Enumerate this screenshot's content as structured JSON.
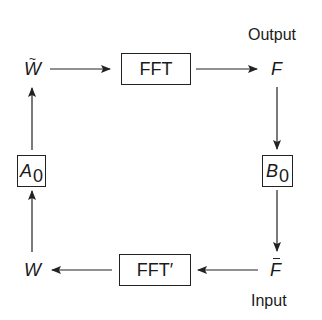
{
  "diagram": {
    "type": "iterative-algorithm-loop",
    "labels": {
      "output": "Output",
      "input": "Input"
    },
    "nodes": {
      "w_tilde": {
        "symbol": "W",
        "decoration": "tilde",
        "tilde": "~"
      },
      "f": {
        "symbol": "F"
      },
      "w": {
        "symbol": "W"
      },
      "f_bar": {
        "symbol": "F",
        "decoration": "bar"
      }
    },
    "boxes": {
      "fft": {
        "label": "FFT"
      },
      "fft_prime": {
        "label": "FFT′"
      },
      "a0": {
        "symbol": "A",
        "subscript": "0"
      },
      "b0": {
        "symbol": "B",
        "subscript": "0"
      }
    },
    "edges": [
      {
        "from": "w_tilde",
        "to": "fft"
      },
      {
        "from": "fft",
        "to": "f"
      },
      {
        "from": "f",
        "to": "b0"
      },
      {
        "from": "b0",
        "to": "f_bar"
      },
      {
        "from": "f_bar",
        "to": "fft_prime"
      },
      {
        "from": "fft_prime",
        "to": "w"
      },
      {
        "from": "w",
        "to": "a0"
      },
      {
        "from": "a0",
        "to": "w_tilde"
      }
    ],
    "colors": {
      "stroke": "#222222",
      "background": "#ffffff"
    }
  }
}
